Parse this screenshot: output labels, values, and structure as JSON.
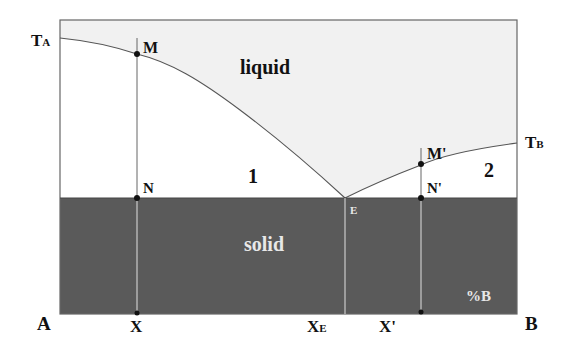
{
  "diagram": {
    "regions": {
      "liquid": "liquid",
      "solid": "solid",
      "region1": "1",
      "region2": "2"
    },
    "axis": {
      "left_component": "A",
      "right_component": "B",
      "composition_label": "%B"
    },
    "temperatures": {
      "ta_main": "T",
      "ta_sub": "A",
      "tb_main": "T",
      "tb_sub": "B"
    },
    "points": {
      "m": "M",
      "n": "N",
      "m_prime": "M'",
      "n_prime": "N'",
      "e": "E"
    },
    "compositions": {
      "x": "X",
      "xe_main": "X",
      "xe_sub": "E",
      "x_prime": "X'"
    },
    "colors": {
      "liquid_fill": "#f1f1f1",
      "solid_fill": "#5a5a5a",
      "line": "#555555",
      "white_line": "#e0e0e0"
    }
  }
}
